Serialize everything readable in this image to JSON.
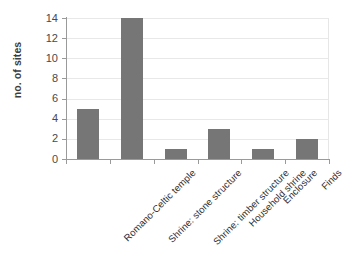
{
  "chart_data": {
    "type": "bar",
    "title": "",
    "subtitle": "",
    "xlabel": "",
    "ylabel": "no. of sites",
    "categories": [
      "Romano-Celtic temple",
      "Shrine: stone structure",
      "Shrine: timber structure",
      "Household shrine",
      "Enclosure",
      "Finds"
    ],
    "values": [
      5,
      14,
      1,
      3,
      1,
      2
    ],
    "ylim": [
      0,
      14
    ],
    "ytick_step": 2,
    "yticks": [
      0,
      2,
      4,
      6,
      8,
      10,
      12,
      14
    ],
    "ytick_labels": [
      "0",
      "2",
      "4",
      "6",
      "8",
      "10",
      "12",
      "14"
    ],
    "grid": true,
    "grid_axis": "y",
    "legend": false,
    "legend_position": "none",
    "bar_color": "#767676",
    "gridline_color": "#e8e8e8",
    "axis_color": "#9a9a9a",
    "background": "#ffffff",
    "annotations": []
  },
  "axes": {
    "y_title": "no. of sites"
  }
}
